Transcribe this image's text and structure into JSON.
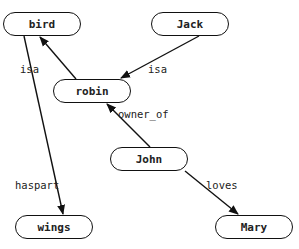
{
  "diagram": {
    "type": "semantic-network",
    "nodes": [
      {
        "id": "bird",
        "label": "bird",
        "x": 3,
        "y": 12
      },
      {
        "id": "jack",
        "label": "Jack",
        "x": 151,
        "y": 12
      },
      {
        "id": "robin",
        "label": "robin",
        "x": 53,
        "y": 79
      },
      {
        "id": "john",
        "label": "John",
        "x": 110,
        "y": 147
      },
      {
        "id": "wings",
        "label": "wings",
        "x": 15,
        "y": 215
      },
      {
        "id": "mary",
        "label": "Mary",
        "x": 215,
        "y": 215
      }
    ],
    "edges": [
      {
        "from": "robin",
        "to": "bird",
        "label": "isa",
        "label_x": 20,
        "label_y": 63
      },
      {
        "from": "jack",
        "to": "robin",
        "label": "isa",
        "label_x": 148,
        "label_y": 63
      },
      {
        "from": "john",
        "to": "robin",
        "label": "owner_of",
        "label_x": 118,
        "label_y": 108
      },
      {
        "from": "bird",
        "to": "wings",
        "label": "haspart",
        "label_x": 15,
        "label_y": 179
      },
      {
        "from": "john",
        "to": "mary",
        "label": "loves",
        "label_x": 206,
        "label_y": 179
      }
    ],
    "line_color": "#111111"
  }
}
